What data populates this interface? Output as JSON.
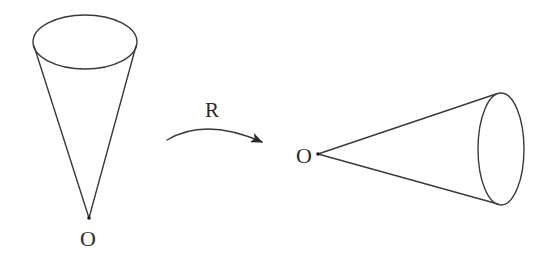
{
  "figure": {
    "stroke_color": "#3a3a3a",
    "background": "#ffffff",
    "left_cone": {
      "apex_label": "O",
      "orientation": "vertical, opening upward",
      "apex": [
        89,
        218
      ],
      "base_ellipse": {
        "cx": 85,
        "cy": 42,
        "rx": 52,
        "ry": 27
      },
      "side_left_top": [
        34,
        45
      ],
      "side_right_top": [
        136,
        45
      ]
    },
    "transformation": {
      "label": "R",
      "arrow": "curved arc arrow pointing right",
      "start": [
        167,
        140
      ],
      "end": [
        263,
        142
      ]
    },
    "right_cone": {
      "apex_label": "O",
      "orientation": "horizontal, opening rightward",
      "apex": [
        318,
        154
      ],
      "base_ellipse": {
        "cx": 501,
        "cy": 149,
        "rx": 23,
        "ry": 56
      },
      "side_top_end": [
        494,
        95
      ],
      "side_bottom_end": [
        497,
        203
      ]
    }
  }
}
